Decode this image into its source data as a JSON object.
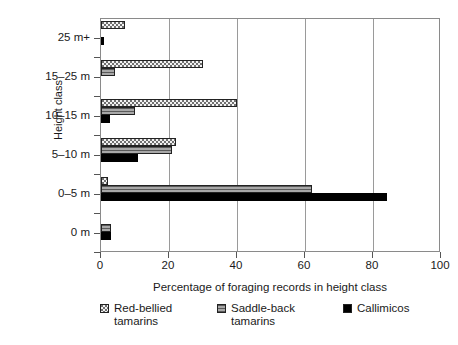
{
  "chart_data": {
    "type": "bar",
    "orientation": "horizontal",
    "title": "",
    "xlabel": "Percentage of foraging records in height class",
    "ylabel": "Height class",
    "categories": [
      "25 m+",
      "15–25 m",
      "10–15 m",
      "5–10 m",
      "0–5 m",
      "0 m"
    ],
    "xlim": [
      0,
      100
    ],
    "xticks": [
      0,
      20,
      40,
      60,
      80,
      100
    ],
    "xtick_labels": [
      "0",
      "20",
      "40",
      "60",
      "80",
      "100"
    ],
    "grid": "vertical",
    "legend_position": "below",
    "series": [
      {
        "name": "Red-bellied tamarins",
        "pattern": "stipple",
        "color": "#f2f2f2",
        "values": [
          7,
          30,
          40,
          22,
          2,
          0
        ]
      },
      {
        "name": "Saddle-back tamarins",
        "pattern": "horizontal-stripes",
        "color": "#8c8c8c",
        "values": [
          0,
          4,
          10,
          21,
          62,
          3
        ]
      },
      {
        "name": "Callimicos",
        "pattern": "solid",
        "color": "#000000",
        "values": [
          1,
          0,
          2.5,
          11,
          84,
          3
        ]
      }
    ]
  },
  "axes": {
    "y_title": "Height class",
    "x_title": "Percentage of foraging records in height class"
  },
  "legend": {
    "items": [
      {
        "label": "Red-bellied\ntamarins",
        "swatch": "stipple-swatch"
      },
      {
        "label": "Saddle-back\ntamarins",
        "swatch": "striped-swatch"
      },
      {
        "label": "Callimicos",
        "swatch": "solid-black-swatch"
      }
    ]
  },
  "caption": ""
}
